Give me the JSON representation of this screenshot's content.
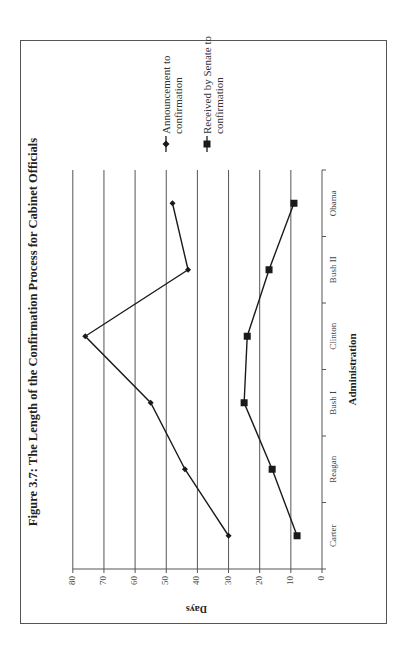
{
  "figure": {
    "title": "Figure 3.7: The Length of the Confirmation Process for Cabinet Officials",
    "orientation": "rotated 90° counter-clockwise on page"
  },
  "axes": {
    "y_label": "Days",
    "x_label": "Administration",
    "y_ticks": [
      "0",
      "10",
      "20",
      "30",
      "40",
      "50",
      "60",
      "70",
      "80"
    ]
  },
  "legend": [
    {
      "label_line1": "Announcement to",
      "label_line2": "confirmation",
      "marker": "diamond"
    },
    {
      "label_line1": "Received by Senate to",
      "label_line2": "confirmation",
      "marker": "square"
    }
  ],
  "categories": [
    "Carter",
    "Reagan",
    "Bush I",
    "Clinton",
    "Bush II",
    "Obama"
  ],
  "chart_data": {
    "type": "line",
    "title": "Figure 3.7: The Length of the Confirmation Process for Cabinet Officials",
    "xlabel": "Administration",
    "ylabel": "Days",
    "categories": [
      "Carter",
      "Reagan",
      "Bush I",
      "Clinton",
      "Bush II",
      "Obama"
    ],
    "series": [
      {
        "name": "Announcement to confirmation",
        "marker": "diamond",
        "values": [
          30,
          44,
          55,
          76,
          43,
          48
        ]
      },
      {
        "name": "Received by Senate to confirmation",
        "marker": "square",
        "values": [
          8,
          16,
          25,
          24,
          17,
          9
        ]
      }
    ],
    "ylim": [
      0,
      80
    ],
    "yticks": [
      0,
      10,
      20,
      30,
      40,
      50,
      60,
      70,
      80
    ],
    "grid": {
      "horizontal": true,
      "vertical": false
    },
    "legend_position": "right",
    "colors": {
      "lines": "#1a1a1a",
      "grid": "#555555",
      "frame": "#555555"
    }
  }
}
